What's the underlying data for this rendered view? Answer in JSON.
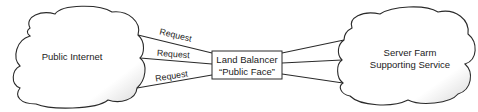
{
  "diagram": {
    "type": "network-architecture",
    "nodes": [
      {
        "id": "public-internet",
        "shape": "cloud",
        "label": "Public Internet"
      },
      {
        "id": "load-balancer",
        "shape": "rectangle",
        "label_line1": "Land Balancer",
        "label_line2": "“Public Face”"
      },
      {
        "id": "server-farm",
        "shape": "cloud",
        "label_line1": "Server Farm",
        "label_line2": "Supporting Service"
      }
    ],
    "edges": [
      {
        "from": "public-internet",
        "to": "load-balancer",
        "label": "Request"
      },
      {
        "from": "public-internet",
        "to": "load-balancer",
        "label": "Request"
      },
      {
        "from": "public-internet",
        "to": "load-balancer",
        "label": "Request"
      },
      {
        "from": "load-balancer",
        "to": "server-farm",
        "label": ""
      },
      {
        "from": "load-balancer",
        "to": "server-farm",
        "label": ""
      },
      {
        "from": "load-balancer",
        "to": "server-farm",
        "label": ""
      }
    ],
    "colors": {
      "stroke": "#2a2a2a",
      "cloud_fill": "#ffffff",
      "cloud_shade": "#d8d8d8",
      "text": "#222222"
    }
  }
}
